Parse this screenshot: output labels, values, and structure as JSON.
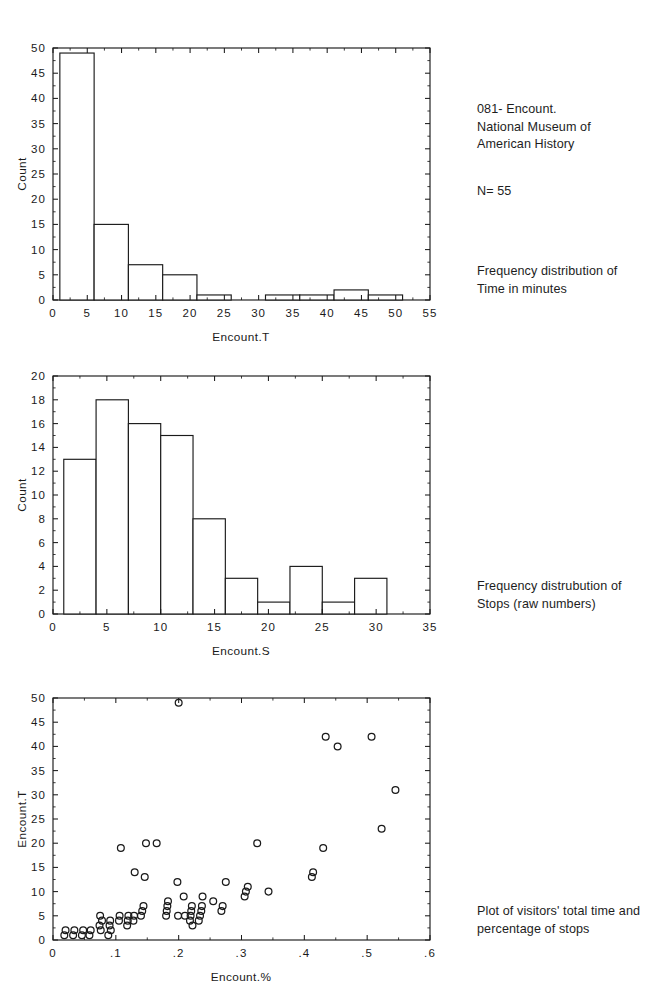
{
  "annotations": {
    "record_id": "081- Encount.\nNational Museum of\nAmerican History",
    "sample_size": "N= 55",
    "caption_hist_time": "Frequency distribution of\nTime in minutes",
    "caption_hist_stops": "Frequency distrubution of\nStops (raw numbers)",
    "caption_scatter": "Plot of visitors' total time and\npercentage of stops"
  },
  "chart_data": [
    {
      "id": "hist-time",
      "type": "bar",
      "title": "",
      "xlabel": "Encount.T",
      "ylabel": "Count",
      "xlim": [
        0,
        55
      ],
      "ylim": [
        0,
        50
      ],
      "xticks": [
        0,
        5,
        10,
        15,
        20,
        25,
        30,
        35,
        40,
        45,
        50,
        55
      ],
      "xticklabels": [
        "0",
        "5",
        "10",
        "15",
        "20",
        "25",
        "30",
        "35",
        "40",
        "45",
        "50",
        "55"
      ],
      "yticks": [
        0,
        5,
        10,
        15,
        20,
        25,
        30,
        35,
        40,
        45,
        50
      ],
      "yticklabels": [
        "0",
        "5",
        "10",
        "15",
        "20",
        "25",
        "30",
        "35",
        "40",
        "45",
        "50"
      ],
      "grid": false,
      "legend": "none",
      "bin_width": 5,
      "bins": [
        {
          "x0": 1,
          "x1": 6,
          "count": 49
        },
        {
          "x0": 6,
          "x1": 11,
          "count": 15
        },
        {
          "x0": 11,
          "x1": 16,
          "count": 7
        },
        {
          "x0": 16,
          "x1": 21,
          "count": 5
        },
        {
          "x0": 21,
          "x1": 26,
          "count": 1
        },
        {
          "x0": 26,
          "x1": 31,
          "count": 0
        },
        {
          "x0": 31,
          "x1": 36,
          "count": 1
        },
        {
          "x0": 36,
          "x1": 41,
          "count": 1
        },
        {
          "x0": 41,
          "x1": 46,
          "count": 2
        },
        {
          "x0": 46,
          "x1": 51,
          "count": 1
        }
      ]
    },
    {
      "id": "hist-stops",
      "type": "bar",
      "title": "",
      "xlabel": "Encount.S",
      "ylabel": "Count",
      "xlim": [
        0,
        35
      ],
      "ylim": [
        0,
        20
      ],
      "xticks": [
        0,
        5,
        10,
        15,
        20,
        25,
        30,
        35
      ],
      "xticklabels": [
        "0",
        "5",
        "10",
        "15",
        "20",
        "25",
        "30",
        "35"
      ],
      "yticks": [
        0,
        2,
        4,
        6,
        8,
        10,
        12,
        14,
        16,
        18,
        20
      ],
      "yticklabels": [
        "0",
        "2",
        "4",
        "6",
        "8",
        "10",
        "12",
        "14",
        "16",
        "18",
        "20"
      ],
      "grid": false,
      "legend": "none",
      "bin_width": 3,
      "bins": [
        {
          "x0": 1,
          "x1": 4,
          "count": 13
        },
        {
          "x0": 4,
          "x1": 7,
          "count": 18
        },
        {
          "x0": 7,
          "x1": 10,
          "count": 16
        },
        {
          "x0": 10,
          "x1": 13,
          "count": 15
        },
        {
          "x0": 13,
          "x1": 16,
          "count": 8
        },
        {
          "x0": 16,
          "x1": 19,
          "count": 3
        },
        {
          "x0": 19,
          "x1": 22,
          "count": 1
        },
        {
          "x0": 22,
          "x1": 25,
          "count": 4
        },
        {
          "x0": 25,
          "x1": 28,
          "count": 1
        },
        {
          "x0": 28,
          "x1": 31,
          "count": 3
        }
      ]
    },
    {
      "id": "scatter-time-vs-pct",
      "type": "scatter",
      "title": "",
      "xlabel": "Encount.%",
      "ylabel": "Encount.T",
      "xlim": [
        0,
        0.6
      ],
      "ylim": [
        0,
        50
      ],
      "xticks": [
        0,
        0.1,
        0.2,
        0.3,
        0.4,
        0.5,
        0.6
      ],
      "xticklabels": [
        "0",
        ".1",
        ".2",
        ".3",
        ".4",
        ".5",
        ".6"
      ],
      "yticks": [
        0,
        5,
        10,
        15,
        20,
        25,
        30,
        35,
        40,
        45,
        50
      ],
      "yticklabels": [
        "0",
        "5",
        "10",
        "15",
        "20",
        "25",
        "30",
        "35",
        "40",
        "45",
        "50"
      ],
      "grid": false,
      "legend": "none",
      "marker": "open-circle",
      "points": [
        [
          0.018,
          1
        ],
        [
          0.02,
          2
        ],
        [
          0.032,
          1
        ],
        [
          0.034,
          2
        ],
        [
          0.046,
          1
        ],
        [
          0.048,
          2
        ],
        [
          0.058,
          1
        ],
        [
          0.06,
          2
        ],
        [
          0.074,
          3
        ],
        [
          0.075,
          5
        ],
        [
          0.076,
          2
        ],
        [
          0.078,
          4
        ],
        [
          0.088,
          1
        ],
        [
          0.09,
          3
        ],
        [
          0.091,
          4
        ],
        [
          0.092,
          2
        ],
        [
          0.105,
          4
        ],
        [
          0.106,
          5
        ],
        [
          0.108,
          19
        ],
        [
          0.118,
          3
        ],
        [
          0.119,
          4
        ],
        [
          0.12,
          5
        ],
        [
          0.128,
          4
        ],
        [
          0.129,
          5
        ],
        [
          0.13,
          14
        ],
        [
          0.14,
          5
        ],
        [
          0.142,
          6
        ],
        [
          0.144,
          7
        ],
        [
          0.146,
          13
        ],
        [
          0.148,
          20
        ],
        [
          0.165,
          20
        ],
        [
          0.18,
          5
        ],
        [
          0.181,
          6
        ],
        [
          0.182,
          7
        ],
        [
          0.183,
          8
        ],
        [
          0.198,
          12
        ],
        [
          0.199,
          5
        ],
        [
          0.2,
          49
        ],
        [
          0.208,
          9
        ],
        [
          0.21,
          5
        ],
        [
          0.218,
          4
        ],
        [
          0.219,
          5
        ],
        [
          0.22,
          6
        ],
        [
          0.221,
          7
        ],
        [
          0.222,
          3
        ],
        [
          0.232,
          4
        ],
        [
          0.234,
          5
        ],
        [
          0.236,
          6
        ],
        [
          0.237,
          7
        ],
        [
          0.238,
          9
        ],
        [
          0.255,
          8
        ],
        [
          0.268,
          6
        ],
        [
          0.27,
          7
        ],
        [
          0.275,
          12
        ],
        [
          0.305,
          9
        ],
        [
          0.307,
          10
        ],
        [
          0.31,
          11
        ],
        [
          0.325,
          20
        ],
        [
          0.343,
          10
        ],
        [
          0.412,
          13
        ],
        [
          0.414,
          14
        ],
        [
          0.43,
          19
        ],
        [
          0.434,
          42
        ],
        [
          0.453,
          40
        ],
        [
          0.507,
          42
        ],
        [
          0.523,
          23
        ],
        [
          0.545,
          31
        ]
      ]
    }
  ]
}
